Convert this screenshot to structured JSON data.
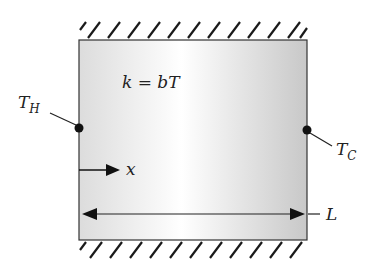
{
  "diagram": {
    "conductivity_label": "k = bT",
    "hot_label": "T",
    "hot_sub": "H",
    "cold_label": "T",
    "cold_sub": "C",
    "x_label": "x",
    "length_label": "L",
    "colors": {
      "outline": "#333333",
      "hatch": "#1a1a1a",
      "fill_light": "#ffffff",
      "fill_dark": "#cfcfcf"
    }
  }
}
